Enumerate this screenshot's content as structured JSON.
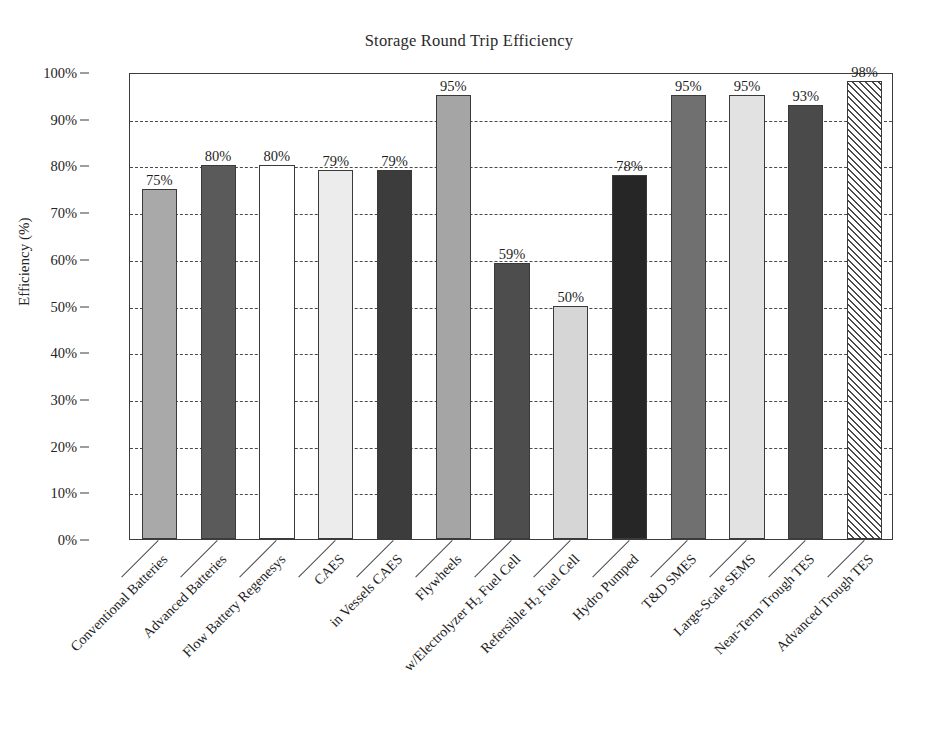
{
  "chart_data": {
    "type": "bar",
    "title": "Storage Round Trip Efficiency",
    "xlabel": "",
    "ylabel": "Efficiency (%)",
    "ylim": [
      0,
      100
    ],
    "ytick_labels": [
      "0%",
      "10%",
      "20%",
      "30%",
      "40%",
      "50%",
      "60%",
      "70%",
      "80%",
      "90%",
      "100%"
    ],
    "ytick_values": [
      0,
      10,
      20,
      30,
      40,
      50,
      60,
      70,
      80,
      90,
      100
    ],
    "grid": true,
    "grid_style": "dashed-horizontal",
    "legend": "none",
    "value_label_suffix": "%",
    "categories": [
      "Conventional Batteries",
      "Advanced Batteries",
      "Flow Battery Regenesys",
      "CAES",
      "in Vessels CAES",
      "Flywheels",
      "w/Electrolyzer H2 Fuel Cell",
      "Refersible H2 Fuel Cell",
      "Hydro Pumped",
      "T&D SMES",
      "Large-Scale SEMS",
      "Near-Term Trough TES",
      "Advanced Trough TES"
    ],
    "values": [
      75,
      80,
      80,
      79,
      79,
      95,
      59,
      50,
      78,
      95,
      95,
      93,
      98
    ],
    "value_labels": [
      "75%",
      "80%",
      "80%",
      "79%",
      "79%",
      "95%",
      "59%",
      "50%",
      "78%",
      "95%",
      "95%",
      "93%",
      "98%"
    ],
    "bar_fills": [
      "#a9a9a9",
      "#5a5a5a",
      "#ffffff",
      "#ececec",
      "#3c3c3c",
      "#a5a5a5",
      "#4d4d4d",
      "#d6d6d6",
      "#262626",
      "#707070",
      "#e2e2e2",
      "#4a4a4a",
      "hatch"
    ],
    "bar_edge_color": "#3a3a3a",
    "axis_color": "#3c3c3c",
    "grid_color": "#4a4a4a",
    "background": "#ffffff",
    "text_color": "#1f1f1f"
  },
  "categories_display": [
    "Conventional Batteries",
    "Advanced Batteries",
    "Flow Battery Regenesys",
    "CAES",
    "in Vessels CAES",
    "w/Electrolyzer H",
    "Refersible H",
    "Flywheels",
    "Hydro Pumped",
    "T&D SMES",
    "Large-Scale SEMS",
    "Near-Term Trough TES",
    "Advanced Trough TES"
  ]
}
